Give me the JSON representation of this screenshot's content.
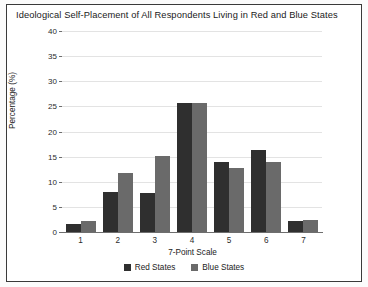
{
  "chart_data": {
    "type": "bar",
    "title": "Ideological Self-Placement of All Respondents Living in Red and Blue States",
    "xlabel": "7-Point Scale",
    "ylabel": "Percentage (%)",
    "categories": [
      "1",
      "2",
      "3",
      "4",
      "5",
      "6",
      "7"
    ],
    "series": [
      {
        "name": "Red States",
        "color": "#2f2f2f",
        "values": [
          1.5,
          7.9,
          7.8,
          25.7,
          13.9,
          16.3,
          2.2
        ]
      },
      {
        "name": "Blue States",
        "color": "#6a6a6a",
        "values": [
          2.2,
          11.8,
          15.1,
          25.7,
          12.8,
          14.0,
          2.3
        ]
      }
    ],
    "ylim": [
      0,
      40
    ],
    "yticks": [
      0,
      5,
      10,
      15,
      20,
      25,
      30,
      35,
      40
    ],
    "ytick_labels": [
      "0",
      "5",
      "10",
      "15",
      "20",
      "25",
      "30",
      "35",
      "40"
    ],
    "grid": true,
    "legend_position": "bottom"
  }
}
